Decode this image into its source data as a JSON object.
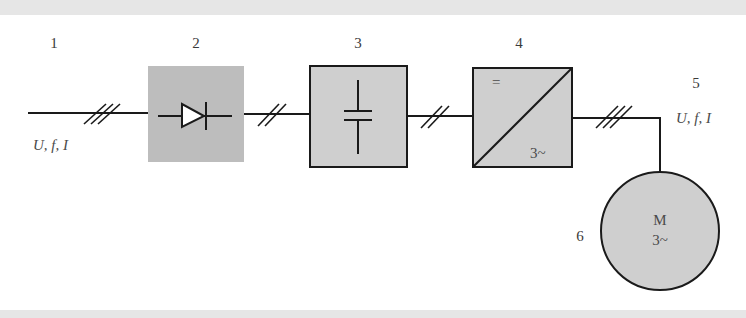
{
  "diagram": {
    "colors": {
      "block_fill": "#cfcfcf",
      "rectifier_fill": "#bdbdbd",
      "line": "#1a1a1a",
      "label": "#3a3a3a",
      "band": "#e6e6e6"
    },
    "labels": {
      "n1": "1",
      "n2": "2",
      "n3": "3",
      "n4": "4",
      "n5": "5",
      "n6": "6",
      "input_quantities": "U, f, I",
      "output_quantities": "U, f, I"
    },
    "blocks": [
      {
        "id": 2,
        "name": "rectifier",
        "symbol": "diode-icon"
      },
      {
        "id": 3,
        "name": "dc-link",
        "symbol": "capacitor-icon"
      },
      {
        "id": 4,
        "name": "inverter",
        "symbol": "dc-ac-converter-icon",
        "top_text": "=",
        "bottom_text": "3~"
      },
      {
        "id": 6,
        "name": "motor",
        "symbol": "motor-icon",
        "line1": "M",
        "line2": "3~"
      }
    ]
  }
}
